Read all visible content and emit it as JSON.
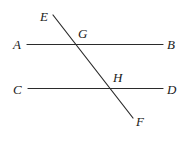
{
  "diagram": {
    "canvas": {
      "width": 188,
      "height": 143,
      "background": "#ffffff"
    },
    "stroke_color": "#2b2b2b",
    "stroke_width": 1.2,
    "label_color": "#1a1a1a",
    "lines": [
      {
        "name": "line-ab",
        "from_label": "A",
        "to_label": "B",
        "x1": 27,
        "y1": 44.5,
        "x2": 163,
        "y2": 44.5
      },
      {
        "name": "line-cd",
        "from_label": "C",
        "to_label": "D",
        "x1": 28,
        "y1": 88.5,
        "x2": 163,
        "y2": 88.5
      },
      {
        "name": "line-ef",
        "from_label": "E",
        "to_label": "F",
        "x1": 53,
        "y1": 15,
        "x2": 133,
        "y2": 118
      }
    ],
    "labels": [
      {
        "name": "label-e",
        "text": "E",
        "x": 40,
        "y": 21,
        "anchor": "start"
      },
      {
        "name": "label-g",
        "text": "G",
        "x": 78,
        "y": 38,
        "anchor": "start"
      },
      {
        "name": "label-a",
        "text": "A",
        "x": 13,
        "y": 49,
        "anchor": "start"
      },
      {
        "name": "label-b",
        "text": "B",
        "x": 167,
        "y": 49,
        "anchor": "start"
      },
      {
        "name": "label-h",
        "text": "H",
        "x": 113,
        "y": 82,
        "anchor": "start"
      },
      {
        "name": "label-c",
        "text": "C",
        "x": 13,
        "y": 94,
        "anchor": "start"
      },
      {
        "name": "label-d",
        "text": "D",
        "x": 167,
        "y": 94,
        "anchor": "start"
      },
      {
        "name": "label-f",
        "text": "F",
        "x": 136,
        "y": 126,
        "anchor": "start"
      }
    ],
    "intersections": [
      {
        "name": "intersection-g",
        "label": "G",
        "x": 76,
        "y": 44.5,
        "on_lines": [
          "line-ab",
          "line-ef"
        ]
      },
      {
        "name": "intersection-h",
        "label": "H",
        "x": 110,
        "y": 88.5,
        "on_lines": [
          "line-cd",
          "line-ef"
        ]
      }
    ]
  }
}
